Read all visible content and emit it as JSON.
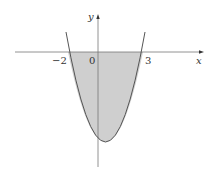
{
  "figure": {
    "equation_implied": "y = (x+2)(x-3)",
    "axis_labels": {
      "x": "x",
      "y": "y"
    },
    "tick_labels": {
      "left_root": "−2",
      "origin": "0",
      "right_root": "3"
    },
    "roots": [
      -2,
      3
    ],
    "shade_color": "#cfcfcf",
    "curve_color": "#555555",
    "axis_color": "#777777"
  }
}
